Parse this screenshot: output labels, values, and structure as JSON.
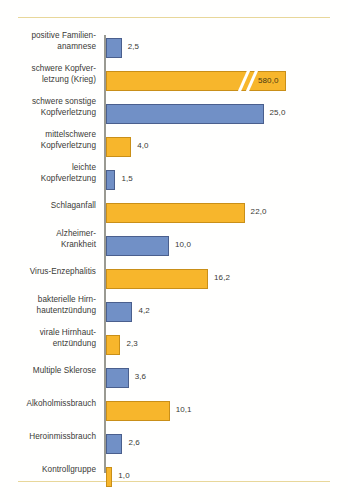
{
  "chart_data": {
    "type": "bar",
    "orientation": "horizontal",
    "title": "",
    "subtitle": "",
    "xlabel": "",
    "ylabel": "",
    "grid": false,
    "legend": false,
    "axis_break": true,
    "axis_break_note": "Balken abgeschnitten",
    "value_decimal_separator": ",",
    "xlim": [
      0,
      26
    ],
    "pixels_per_unit": 6.3,
    "categories": [
      "positive Familien-\nanamnese",
      "schwere Kopfver-\nletzung (Krieg)",
      "schwere sonstige\nKopfverletzung",
      "mittelschwere\nKopfverletzung",
      "leichte\nKopfverletzung",
      "Schlaganfall",
      "Alzheimer-\nKrankheit",
      "Virus-Enzephalitis",
      "bakterielle Hirn-\nhautentzündung",
      "virale Hirnhaut-\nentzündung",
      "Multiple Sklerose",
      "Alkoholmissbrauch",
      "Heroinmissbrauch",
      "Kontrollgruppe"
    ],
    "values": [
      2.5,
      580.0,
      25.0,
      4.0,
      1.5,
      22.0,
      10.0,
      16.2,
      4.2,
      2.3,
      3.6,
      10.1,
      2.6,
      1.0
    ],
    "value_labels": [
      "2,5",
      "580,0",
      "25,0",
      "4,0",
      "1,5",
      "22,0",
      "10,0",
      "16,2",
      "4,2",
      "2,3",
      "3,6",
      "10,1",
      "2,6",
      "1,0"
    ],
    "colors": {
      "blue": "#7190c6",
      "blue_border": "#4a5f8d",
      "orange": "#f7b62c",
      "orange_border": "#c98f18",
      "axis": "#9a9a92",
      "rule": "#e8d79a",
      "text": "#3a3a36"
    },
    "bars": [
      {
        "label_line1": "positive Familien-",
        "label_line2": "anamnese",
        "value_label": "2,5",
        "color": "blue",
        "truncated": false
      },
      {
        "label_line1": "schwere Kopfver-",
        "label_line2": "letzung (Krieg)",
        "value_label": "580,0",
        "color": "orange",
        "truncated": true
      },
      {
        "label_line1": "schwere sonstige",
        "label_line2": "Kopfverletzung",
        "value_label": "25,0",
        "color": "blue",
        "truncated": false
      },
      {
        "label_line1": "mittelschwere",
        "label_line2": "Kopfverletzung",
        "value_label": "4,0",
        "color": "orange",
        "truncated": false
      },
      {
        "label_line1": "leichte",
        "label_line2": "Kopfverletzung",
        "value_label": "1,5",
        "color": "blue",
        "truncated": false
      },
      {
        "label_line1": "Schlaganfall",
        "label_line2": "",
        "value_label": "22,0",
        "color": "orange",
        "truncated": false
      },
      {
        "label_line1": "Alzheimer-",
        "label_line2": "Krankheit",
        "value_label": "10,0",
        "color": "blue",
        "truncated": false
      },
      {
        "label_line1": "Virus-Enzephalitis",
        "label_line2": "",
        "value_label": "16,2",
        "color": "orange",
        "truncated": false
      },
      {
        "label_line1": "bakterielle Hirn-",
        "label_line2": "hautentzündung",
        "value_label": "4,2",
        "color": "blue",
        "truncated": false
      },
      {
        "label_line1": "virale Hirnhaut-",
        "label_line2": "entzündung",
        "value_label": "2,3",
        "color": "orange",
        "truncated": false
      },
      {
        "label_line1": "Multiple Sklerose",
        "label_line2": "",
        "value_label": "3,6",
        "color": "blue",
        "truncated": false
      },
      {
        "label_line1": "Alkoholmissbrauch",
        "label_line2": "",
        "value_label": "10,1",
        "color": "orange",
        "truncated": false
      },
      {
        "label_line1": "Heroinmissbrauch",
        "label_line2": "",
        "value_label": "2,6",
        "color": "blue",
        "truncated": false
      },
      {
        "label_line1": "Kontrollgruppe",
        "label_line2": "",
        "value_label": "1,0",
        "color": "orange",
        "truncated": false
      }
    ]
  }
}
